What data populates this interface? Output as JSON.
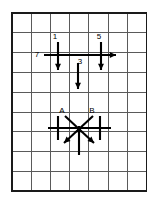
{
  "figure": {
    "background_color": "#ffffff",
    "grid": {
      "columns": 7,
      "rows": 9,
      "x0": 12,
      "y0": 13,
      "cell_width": 19.2,
      "cell_height": 19.8,
      "line_color": "#5a5a5a",
      "border_color": "#1a1a1a",
      "show_grid": true
    },
    "diagrams": [
      {
        "id": "upper-diagram",
        "name": "upper-vector-cluster",
        "labels": [
          {
            "id": "label-1",
            "text": "1",
            "x": 55,
            "y": 39
          },
          {
            "id": "label-5",
            "text": "5",
            "x": 99,
            "y": 39
          },
          {
            "id": "label-7",
            "text": "7",
            "x": 37,
            "y": 57
          },
          {
            "id": "label-3",
            "text": "3",
            "x": 80,
            "y": 64
          }
        ],
        "vectors": [
          {
            "id": "vector-7",
            "label": "7",
            "direction": "right",
            "x1": 44,
            "y1": 55,
            "x2": 116,
            "y2": 55
          },
          {
            "id": "vector-1",
            "label": "1",
            "direction": "down",
            "x1": 58,
            "y1": 42,
            "x2": 58,
            "y2": 70
          },
          {
            "id": "vector-3",
            "label": "3",
            "direction": "down",
            "x1": 78,
            "y1": 63,
            "x2": 78,
            "y2": 89
          },
          {
            "id": "vector-5",
            "label": "5",
            "direction": "down",
            "x1": 101,
            "y1": 42,
            "x2": 101,
            "y2": 70
          }
        ]
      },
      {
        "id": "lower-diagram",
        "name": "lower-vector-cluster",
        "labels": [
          {
            "id": "label-A",
            "text": "A",
            "x": 62,
            "y": 113
          },
          {
            "id": "label-B",
            "text": "B",
            "x": 92,
            "y": 113
          }
        ],
        "vectors": [
          {
            "id": "vector-A",
            "label": "A",
            "direction": "down-left",
            "x1": 93,
            "y1": 116,
            "x2": 64,
            "y2": 143
          },
          {
            "id": "vector-B",
            "label": "B",
            "direction": "down-right",
            "x1": 65,
            "y1": 116,
            "x2": 94,
            "y2": 143
          },
          {
            "id": "vector-up",
            "label": "",
            "direction": "up",
            "x1": 79,
            "y1": 155,
            "x2": 79,
            "y2": 126
          },
          {
            "id": "line-horizontal",
            "label": "",
            "direction": "horizontal-plain",
            "x1": 48,
            "y1": 128,
            "x2": 111,
            "y2": 128
          },
          {
            "id": "tick-left",
            "label": "",
            "direction": "vertical-plain",
            "x1": 58,
            "y1": 116,
            "x2": 58,
            "y2": 140
          },
          {
            "id": "tick-right",
            "label": "",
            "direction": "vertical-plain",
            "x1": 100,
            "y1": 116,
            "x2": 100,
            "y2": 140
          }
        ]
      }
    ]
  },
  "chart_data": {
    "type": "diagram",
    "xlabel": "",
    "ylabel": "",
    "grid": true,
    "grid_columns": 7,
    "grid_rows": 9,
    "series": [
      {
        "name": "upper-cluster",
        "values": [
          {
            "label": "7",
            "direction": "right",
            "length_cells": 3.75
          },
          {
            "label": "1",
            "direction": "down",
            "length_cells": 1.4
          },
          {
            "label": "3",
            "direction": "down",
            "length_cells": 1.3
          },
          {
            "label": "5",
            "direction": "down",
            "length_cells": 1.4
          }
        ]
      },
      {
        "name": "lower-cluster",
        "values": [
          {
            "label": "A",
            "direction": "down-left",
            "length_cells": 2.0
          },
          {
            "label": "B",
            "direction": "down-right",
            "length_cells": 2.0
          },
          {
            "label": "",
            "direction": "up",
            "length_cells": 1.5
          },
          {
            "label": "",
            "direction": "horizontal-plain",
            "length_cells": 3.3
          }
        ]
      }
    ]
  }
}
